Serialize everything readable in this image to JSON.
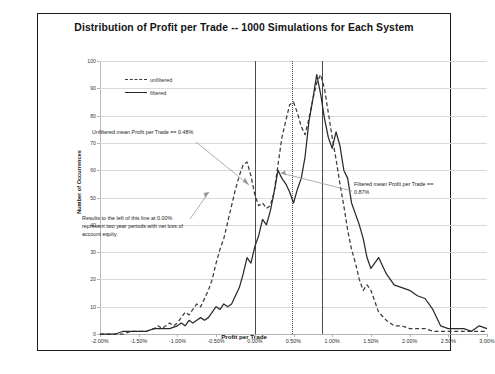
{
  "chart_data": {
    "type": "line",
    "title": "Distribution of Profit per Trade -- 1000 Simulations for Each System",
    "xlabel": "Profit per Trade",
    "ylabel": "Number of Occurrences",
    "xlim": [
      -2.0,
      3.0
    ],
    "ylim": [
      0,
      100
    ],
    "grid": true,
    "legend_position": "top-left",
    "xticks": [
      "-2.00%",
      "-1.50%",
      "-1.00%",
      "-0.50%",
      "0.00%",
      "0.50%",
      "1.00%",
      "1.50%",
      "2.00%",
      "2.50%",
      "3.00%"
    ],
    "xtick_values": [
      -2.0,
      -1.5,
      -1.0,
      -0.5,
      0.0,
      0.5,
      1.0,
      1.5,
      2.0,
      2.5,
      3.0
    ],
    "yticks": [
      "0",
      "10",
      "20",
      "30",
      "40",
      "50",
      "60",
      "70",
      "80",
      "90",
      "100"
    ],
    "ytick_values": [
      0,
      10,
      20,
      30,
      40,
      50,
      60,
      70,
      80,
      90,
      100
    ],
    "series": [
      {
        "name": "unfiltered",
        "style": "dashed",
        "color": "#3a3a3a",
        "x": [
          -2.0,
          -1.9,
          -1.8,
          -1.7,
          -1.6,
          -1.5,
          -1.4,
          -1.3,
          -1.25,
          -1.2,
          -1.15,
          -1.1,
          -1.05,
          -1.0,
          -0.95,
          -0.9,
          -0.85,
          -0.8,
          -0.75,
          -0.7,
          -0.65,
          -0.6,
          -0.55,
          -0.5,
          -0.45,
          -0.4,
          -0.35,
          -0.3,
          -0.25,
          -0.2,
          -0.15,
          -0.1,
          -0.05,
          0.0,
          0.05,
          0.1,
          0.15,
          0.2,
          0.25,
          0.3,
          0.35,
          0.4,
          0.45,
          0.5,
          0.55,
          0.6,
          0.65,
          0.7,
          0.75,
          0.8,
          0.85,
          0.9,
          0.95,
          1.0,
          1.05,
          1.1,
          1.15,
          1.2,
          1.25,
          1.3,
          1.35,
          1.4,
          1.45,
          1.5,
          1.6,
          1.7,
          1.8,
          1.9,
          2.0,
          2.1,
          2.2,
          2.3,
          2.4,
          2.5,
          2.6,
          2.7,
          2.8,
          2.9,
          3.0
        ],
        "values": [
          0,
          0,
          0,
          0,
          1,
          1,
          1,
          2,
          3,
          2,
          3,
          4,
          3,
          4,
          6,
          8,
          7,
          9,
          11,
          10,
          13,
          16,
          20,
          26,
          31,
          35,
          41,
          47,
          53,
          58,
          62,
          63,
          58,
          51,
          47,
          48,
          46,
          47,
          52,
          62,
          72,
          78,
          84,
          85,
          81,
          76,
          73,
          79,
          86,
          92,
          95,
          90,
          81,
          72,
          64,
          55,
          47,
          38,
          31,
          26,
          20,
          16,
          18,
          16,
          8,
          5,
          3,
          3,
          2,
          2,
          2,
          1,
          1,
          1,
          1,
          1,
          1,
          1,
          1
        ]
      },
      {
        "name": "filtered",
        "style": "solid",
        "color": "#2a2a2a",
        "x": [
          -2.0,
          -1.9,
          -1.8,
          -1.7,
          -1.6,
          -1.5,
          -1.4,
          -1.3,
          -1.2,
          -1.1,
          -1.0,
          -0.95,
          -0.9,
          -0.85,
          -0.8,
          -0.75,
          -0.7,
          -0.65,
          -0.6,
          -0.55,
          -0.5,
          -0.45,
          -0.4,
          -0.35,
          -0.3,
          -0.25,
          -0.2,
          -0.15,
          -0.1,
          -0.05,
          0.0,
          0.05,
          0.1,
          0.15,
          0.2,
          0.25,
          0.3,
          0.35,
          0.4,
          0.45,
          0.5,
          0.55,
          0.6,
          0.65,
          0.7,
          0.75,
          0.8,
          0.85,
          0.9,
          0.95,
          1.0,
          1.05,
          1.1,
          1.15,
          1.2,
          1.25,
          1.3,
          1.35,
          1.4,
          1.45,
          1.5,
          1.6,
          1.7,
          1.8,
          1.9,
          2.0,
          2.1,
          2.2,
          2.3,
          2.4,
          2.5,
          2.6,
          2.7,
          2.8,
          2.9,
          3.0
        ],
        "values": [
          0,
          0,
          0,
          1,
          1,
          1,
          1,
          2,
          2,
          2,
          3,
          4,
          3,
          5,
          4,
          5,
          6,
          5,
          6,
          8,
          10,
          9,
          11,
          10,
          11,
          14,
          17,
          22,
          28,
          26,
          32,
          36,
          42,
          40,
          45,
          52,
          60,
          57,
          55,
          52,
          48,
          53,
          57,
          65,
          78,
          86,
          95,
          88,
          79,
          72,
          68,
          74,
          69,
          60,
          57,
          48,
          44,
          40,
          35,
          28,
          24,
          28,
          22,
          18,
          17,
          16,
          14,
          13,
          9,
          3,
          2,
          2,
          2,
          1,
          3,
          2
        ]
      }
    ],
    "reference_lines": [
      {
        "name": "zero-line",
        "x": 0.0,
        "style": "solid",
        "label": "0.00%"
      },
      {
        "name": "unfiltered-mean-line",
        "x": 0.48,
        "style": "dotted",
        "label": "0.48%"
      },
      {
        "name": "filtered-mean-line",
        "x": 0.87,
        "style": "solid",
        "label": "0.87%"
      }
    ],
    "annotations": [
      {
        "name": "unfiltered-mean",
        "text": "Unfiltered mean Profit per Trade == 0.48%"
      },
      {
        "name": "loss-note",
        "text": "Results to the left of this line at 0.00% represent two year periods with net loss of account equity."
      },
      {
        "name": "filtered-mean",
        "text": "Filtered mean Profit per Trade == 0.87%"
      }
    ]
  },
  "legend": {
    "items": [
      {
        "label": "unfiltered"
      },
      {
        "label": "filtered"
      }
    ]
  },
  "colors": {
    "frame": "#1c1c1c",
    "grid": "#d9d9d9",
    "unfiltered": "#3a3a3a",
    "filtered": "#2a2a2a",
    "background": "#ffffff"
  }
}
